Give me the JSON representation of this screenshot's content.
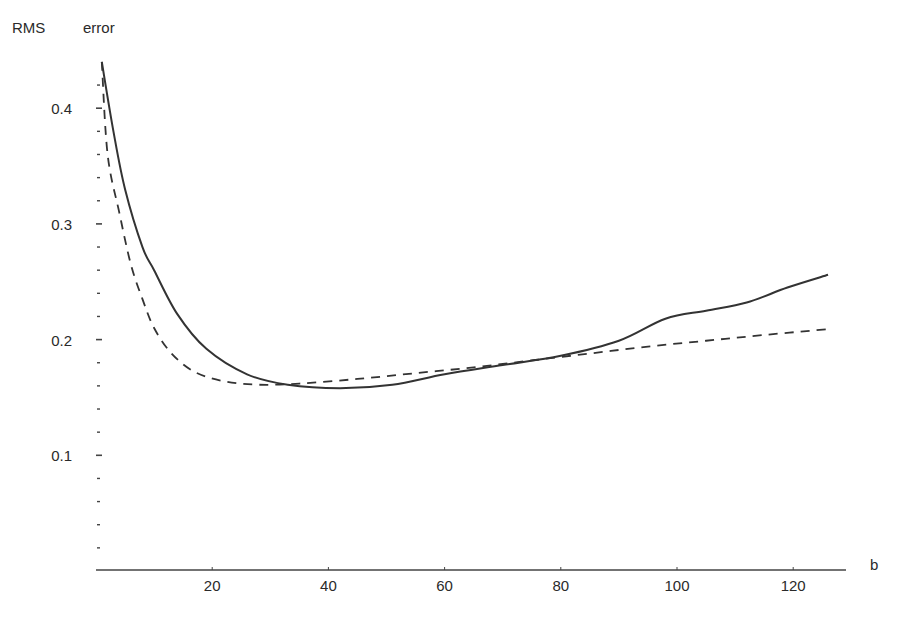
{
  "chart_data": {
    "type": "line",
    "title": "",
    "ylabel": "RMS error",
    "ylabel_parts": [
      "RMS",
      "error"
    ],
    "xlabel": "b",
    "xlim": [
      0,
      128
    ],
    "ylim": [
      0,
      0.44
    ],
    "x_ticks": [
      20,
      40,
      60,
      80,
      100,
      120
    ],
    "x_tick_labels": [
      "20",
      "40",
      "60",
      "80",
      "100",
      "120"
    ],
    "y_ticks": [
      0.1,
      0.2,
      0.3,
      0.4
    ],
    "y_tick_labels": [
      "0.1",
      "0.2",
      "0.3",
      "0.4"
    ],
    "y_minor_step": 0.02,
    "grid": false,
    "legend": null,
    "series": [
      {
        "name": "solid",
        "style": "solid",
        "x": [
          1,
          3,
          5,
          8,
          10,
          14,
          19,
          26,
          33,
          42,
          51,
          60,
          70,
          80,
          90,
          98,
          105,
          112,
          119,
          126
        ],
        "y": [
          0.44,
          0.38,
          0.33,
          0.28,
          0.26,
          0.222,
          0.192,
          0.17,
          0.161,
          0.158,
          0.161,
          0.17,
          0.178,
          0.186,
          0.199,
          0.218,
          0.225,
          0.232,
          0.245,
          0.256
        ]
      },
      {
        "name": "dashed",
        "style": "dashed",
        "x": [
          1,
          2,
          4,
          6,
          8,
          10,
          13,
          17,
          22,
          28,
          35,
          45,
          55,
          65,
          75,
          85,
          95,
          105,
          115,
          126
        ],
        "y": [
          0.44,
          0.36,
          0.31,
          0.265,
          0.235,
          0.21,
          0.188,
          0.172,
          0.164,
          0.161,
          0.162,
          0.166,
          0.171,
          0.176,
          0.182,
          0.188,
          0.194,
          0.199,
          0.204,
          0.209
        ]
      }
    ]
  },
  "axes": {
    "y_title_left": "RMS",
    "y_title_right": "error",
    "x_title": "b"
  }
}
